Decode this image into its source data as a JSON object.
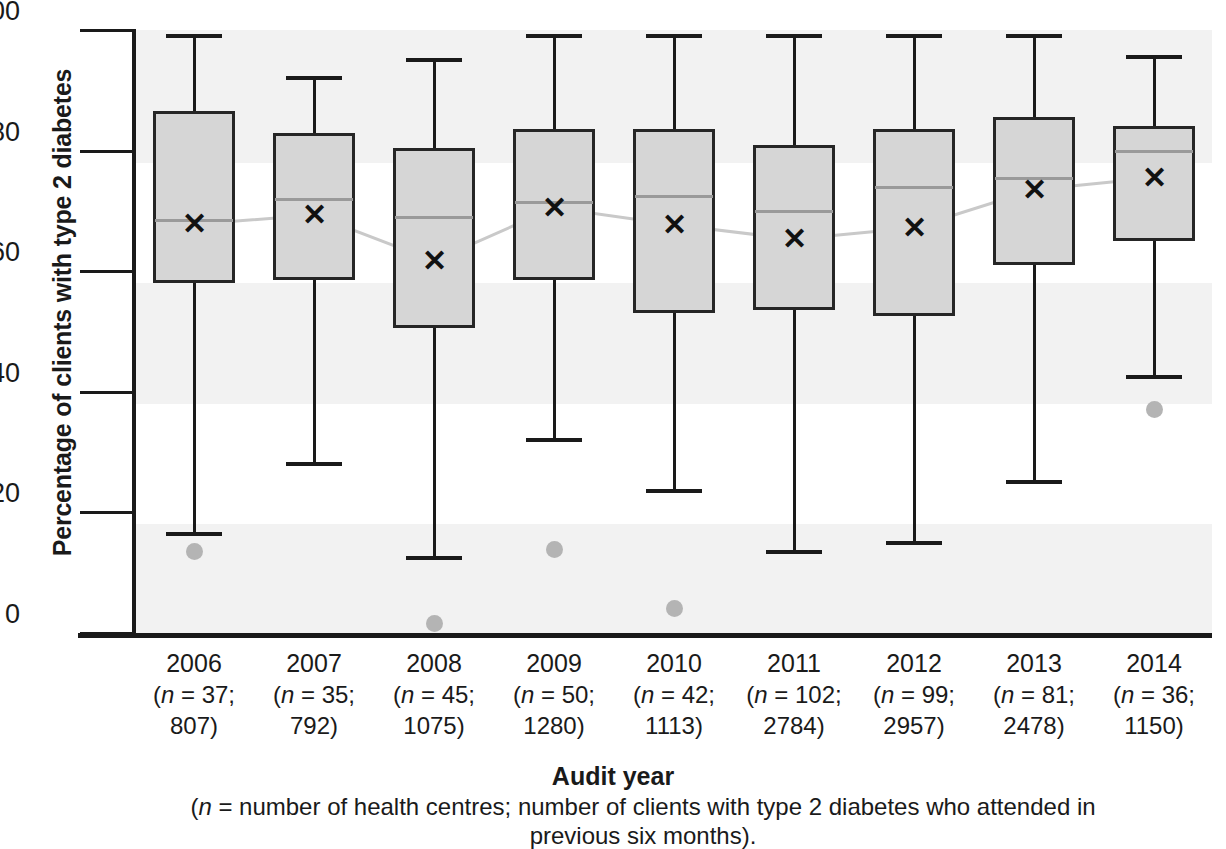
{
  "chart_data": {
    "type": "box",
    "title": "",
    "xlabel": "Audit year",
    "ylabel": "Percentage of clients with type 2 diabetes",
    "ylim": [
      0,
      100
    ],
    "ytick_values": [
      0,
      20,
      40,
      60,
      80,
      100
    ],
    "ytick_labels": [
      "0",
      "20",
      "40",
      "60",
      "80",
      "100"
    ],
    "grid": false,
    "banded_background": true,
    "legend": "",
    "categories": [
      "2006",
      "2007",
      "2008",
      "2009",
      "2010",
      "2011",
      "2012",
      "2013",
      "2014"
    ],
    "category_sublabels": [
      {
        "line1": "(n = 37;",
        "line2": "807)",
        "n_centres": 37,
        "n_clients": 807
      },
      {
        "line1": "(n = 35;",
        "line2": "792)",
        "n_centres": 35,
        "n_clients": 792
      },
      {
        "line1": "(n = 45;",
        "line2": "1075)",
        "n_centres": 45,
        "n_clients": 1075
      },
      {
        "line1": "(n = 50;",
        "line2": "1280)",
        "n_centres": 50,
        "n_clients": 1280
      },
      {
        "line1": "(n = 42;",
        "line2": "1113)",
        "n_centres": 42,
        "n_clients": 1113
      },
      {
        "line1": "(n = 102;",
        "line2": "2784)",
        "n_centres": 102,
        "n_clients": 2784
      },
      {
        "line1": "(n = 99;",
        "line2": "2957)",
        "n_centres": 99,
        "n_clients": 2957
      },
      {
        "line1": "(n = 81;",
        "line2": "2478)",
        "n_centres": 81,
        "n_clients": 2478
      },
      {
        "line1": "(n = 36;",
        "line2": "1150)",
        "n_centres": 36,
        "n_clients": 1150
      }
    ],
    "boxes": [
      {
        "category": "2006",
        "whisker_low": 16.5,
        "q1": 58.0,
        "median": 68.5,
        "mean": 67.8,
        "q3": 86.5,
        "whisker_high": 99.0,
        "outliers": [
          13.5
        ]
      },
      {
        "category": "2007",
        "whisker_low": 28.0,
        "q1": 58.5,
        "median": 72.0,
        "mean": 69.3,
        "q3": 83.0,
        "whisker_high": 92.0,
        "outliers": []
      },
      {
        "category": "2008",
        "whisker_low": 12.5,
        "q1": 50.5,
        "median": 69.0,
        "mean": 61.7,
        "q3": 80.5,
        "whisker_high": 95.0,
        "outliers": [
          1.5
        ]
      },
      {
        "category": "2009",
        "whisker_low": 32.0,
        "q1": 58.5,
        "median": 71.5,
        "mean": 70.5,
        "q3": 83.5,
        "whisker_high": 99.0,
        "outliers": [
          13.8
        ]
      },
      {
        "category": "2010",
        "whisker_low": 23.5,
        "q1": 53.0,
        "median": 72.5,
        "mean": 67.7,
        "q3": 83.5,
        "whisker_high": 99.0,
        "outliers": [
          4.0
        ]
      },
      {
        "category": "2011",
        "whisker_low": 13.5,
        "q1": 53.5,
        "median": 70.0,
        "mean": 65.3,
        "q3": 81.0,
        "whisker_high": 99.0,
        "outliers": []
      },
      {
        "category": "2012",
        "whisker_low": 15.0,
        "q1": 52.5,
        "median": 74.0,
        "mean": 67.2,
        "q3": 83.5,
        "whisker_high": 99.0,
        "outliers": []
      },
      {
        "category": "2013",
        "whisker_low": 25.0,
        "q1": 61.0,
        "median": 75.5,
        "mean": 73.5,
        "q3": 85.5,
        "whisker_high": 99.0,
        "outliers": []
      },
      {
        "category": "2014",
        "whisker_low": 42.5,
        "q1": 65.0,
        "median": 80.0,
        "mean": 75.5,
        "q3": 84.0,
        "whisker_high": 95.5,
        "outliers": [
          37.0
        ]
      }
    ],
    "mean_series": {
      "name": "mean",
      "values": [
        67.8,
        69.3,
        61.7,
        70.5,
        67.7,
        65.3,
        67.2,
        73.5,
        75.5
      ],
      "marker": "x",
      "line_color": "#c9c9c9"
    },
    "colors": {
      "box_fill": "#d6d6d6",
      "box_edge": "#262626",
      "median": "#9a9a9a",
      "mean_marker": "#111111",
      "outlier": "#b4b4b4",
      "band": "#f2f2f2",
      "axis": "#1a1a1a"
    }
  },
  "axis": {
    "y_title": "Percentage of clients with type 2 diabetes",
    "x_title": "Audit year",
    "caption_line1": "(n = number of health centres; number of clients with type 2 diabetes who attended in",
    "caption_line2": "previous six months)."
  }
}
